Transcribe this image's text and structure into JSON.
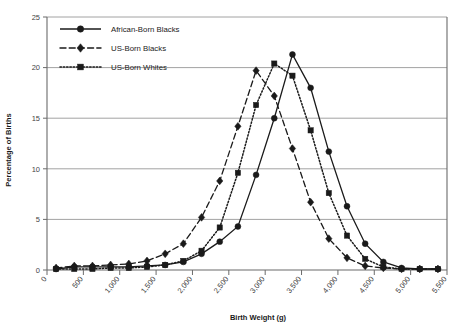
{
  "chart_data": {
    "type": "line",
    "title": "",
    "xlabel": "Birth Weight (g)",
    "ylabel": "Percentage of Births",
    "xlim": [
      0,
      5500
    ],
    "ylim": [
      0,
      25
    ],
    "xtick_labels": [
      "0",
      "500",
      "1,000",
      "1,500",
      "2,000",
      "2,500",
      "3,000",
      "3,500",
      "4,000",
      "4,500",
      "5,000",
      "5,500"
    ],
    "xticks": [
      0,
      500,
      1000,
      1500,
      2000,
      2500,
      3000,
      3500,
      4000,
      4500,
      5000,
      5500
    ],
    "ytick_labels": [
      "0",
      "5",
      "10",
      "15",
      "20",
      "25"
    ],
    "yticks": [
      0,
      5,
      10,
      15,
      20,
      25
    ],
    "grid": "horizontal",
    "legend_position": "top-left",
    "x": [
      125,
      375,
      625,
      875,
      1125,
      1375,
      1625,
      1875,
      2125,
      2375,
      2625,
      2875,
      3125,
      3375,
      3625,
      3875,
      4125,
      4375,
      4625,
      4875,
      5125,
      5375
    ],
    "series": [
      {
        "name": "African-Born Blacks",
        "marker": "circle",
        "line_style": "solid",
        "color": "#1a1a1a",
        "values": [
          0.1,
          0.3,
          0.3,
          0.3,
          0.3,
          0.4,
          0.5,
          0.8,
          1.6,
          2.8,
          4.3,
          9.4,
          15.0,
          21.3,
          18.0,
          11.7,
          6.3,
          2.6,
          0.8,
          0.2,
          0.1,
          0.1
        ]
      },
      {
        "name": "US-Born Blacks",
        "marker": "diamond",
        "line_style": "dashed",
        "color": "#1a1a1a",
        "values": [
          0.2,
          0.4,
          0.4,
          0.5,
          0.6,
          0.9,
          1.6,
          2.6,
          5.2,
          8.8,
          14.2,
          19.7,
          17.2,
          12.0,
          6.7,
          3.1,
          1.2,
          0.4,
          0.2,
          0.1,
          0.1,
          0.1
        ]
      },
      {
        "name": "US-Born Whites",
        "marker": "square",
        "line_style": "dotted",
        "color": "#1a1a1a",
        "values": [
          0.1,
          0.1,
          0.1,
          0.2,
          0.2,
          0.3,
          0.5,
          0.9,
          1.9,
          4.2,
          9.6,
          16.3,
          20.4,
          19.2,
          13.8,
          7.6,
          3.4,
          1.1,
          0.3,
          0.1,
          0.1,
          0.1
        ]
      }
    ]
  },
  "legend": {
    "items": [
      {
        "label": "African-Born Blacks",
        "marker": "circle",
        "style": "solid"
      },
      {
        "label": "US-Born Blacks",
        "marker": "diamond",
        "style": "dashed"
      },
      {
        "label": "US-Born Whites",
        "marker": "square",
        "style": "dotted"
      }
    ]
  }
}
